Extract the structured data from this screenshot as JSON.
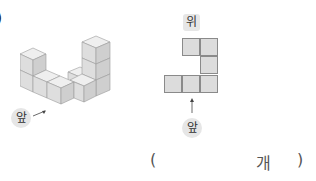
{
  "problem": {
    "number_fragment": ")",
    "front_label": "앞",
    "top_view_label": "위",
    "top_view_front_label": "앞",
    "answer_open": "(",
    "answer_unit": "개",
    "answer_close": ")",
    "answer_value": ""
  },
  "top_view": {
    "cells": [
      {
        "row": 0,
        "col": 1
      },
      {
        "row": 0,
        "col": 2
      },
      {
        "row": 1,
        "col": 2
      },
      {
        "row": 2,
        "col": 0
      },
      {
        "row": 2,
        "col": 1
      },
      {
        "row": 2,
        "col": 2
      }
    ],
    "cell_color": "#dcdcdc",
    "border_color": "#8a8a8a"
  },
  "cube_colors": {
    "top": "#efefef",
    "front": "#dedede",
    "side": "#cfcfcf",
    "edge": "#9a9a9a"
  }
}
